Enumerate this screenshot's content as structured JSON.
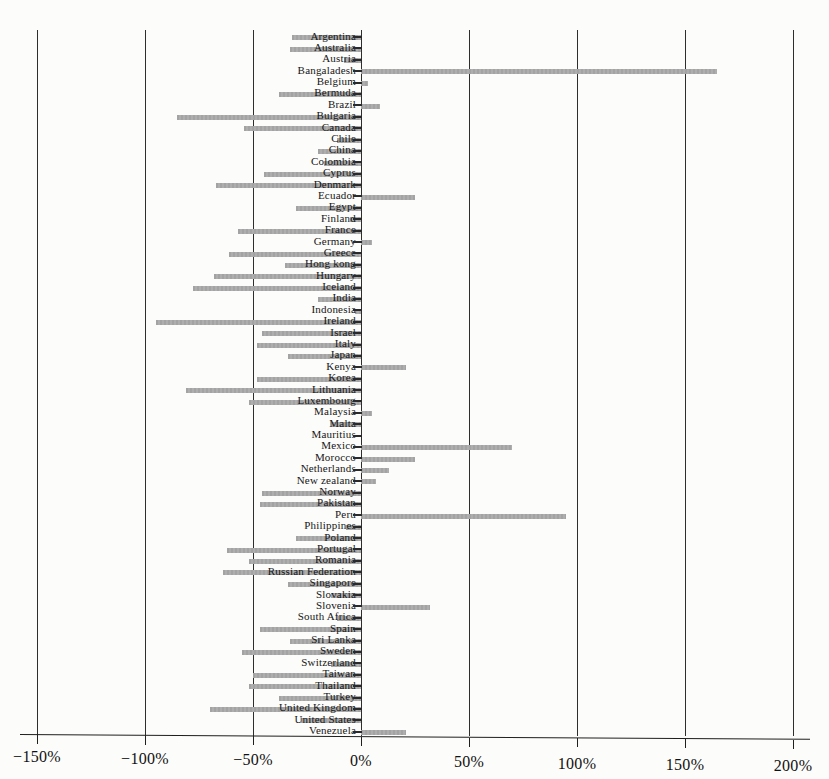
{
  "chart_data": {
    "type": "bar",
    "orientation": "horizontal",
    "title": "",
    "xlabel": "",
    "ylabel": "",
    "legend": "none",
    "grid": "vertical-gridlines-every-50pct",
    "bar_color": "#a8a8a8",
    "grid_color": "#2e2e2e",
    "label_color": "#161616",
    "x_axis": {
      "unit": "%",
      "min": -150,
      "max": 200,
      "tick_step": 50,
      "tick_values": [
        -150,
        -100,
        -50,
        0,
        50,
        100,
        150,
        200
      ],
      "tick_labels": [
        "−150%",
        "−100%",
        "−50%",
        "0%",
        "50%",
        "100%",
        "150%",
        "200%"
      ]
    },
    "categories": [
      "Argentina",
      "Australia",
      "Austria",
      "Bangaladesh",
      "Belgium",
      "Bermuda",
      "Brazil",
      "Bulgaria",
      "Canada",
      "Chile",
      "China",
      "Colombia",
      "Cyprus",
      "Denmark",
      "Ecuador",
      "Egypt",
      "Finland",
      "France",
      "Germany",
      "Greece",
      "Hong kong",
      "Hungary",
      "Iceland",
      "India",
      "Indonesia",
      "Ireland",
      "Israel",
      "Italy",
      "Japan",
      "Kenya",
      "Korea",
      "Lithuania",
      "Luxembourg",
      "Malaysia",
      "Malta",
      "Mauritius",
      "Mexico",
      "Morocco",
      "Netherlands",
      "New zealand",
      "Norway",
      "Pakistan",
      "Peru",
      "Philippines",
      "Poland",
      "Portugal",
      "Romania",
      "Russian Federation",
      "Singapore",
      "Slovakia",
      "Slovenia",
      "South Africa",
      "Spain",
      "Sri Lanka",
      "Sweden",
      "Switzerland",
      "Taiwan",
      "Thailand",
      "Turkey",
      "United Kingdom",
      "United States",
      "Venezuela"
    ],
    "values": [
      -32,
      -33,
      -8,
      165,
      3,
      -38,
      9,
      -85,
      -54,
      -11,
      -20,
      -17,
      -45,
      -67,
      25,
      -30,
      -5,
      -57,
      5,
      -61,
      -35,
      -68,
      -78,
      -20,
      -3,
      -95,
      -46,
      -48,
      -34,
      21,
      -48,
      -81,
      -52,
      5,
      -14,
      0,
      70,
      25,
      13,
      7,
      -46,
      -47,
      95,
      -7,
      -30,
      -62,
      -52,
      -64,
      -34,
      -14,
      32,
      -11,
      -47,
      -33,
      -55,
      -14,
      -50,
      -52,
      -38,
      -70,
      -28,
      21
    ]
  }
}
